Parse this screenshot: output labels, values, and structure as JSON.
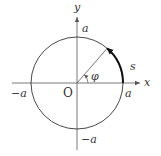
{
  "diagram": {
    "type": "unit-circle-arc-length",
    "colors": {
      "background": "#ffffff",
      "axis": "#555555",
      "circle": "#333333",
      "arc": "#111111",
      "radius": "#555555",
      "text": "#333333"
    },
    "axes": {
      "x_label": "x",
      "y_label": "y"
    },
    "origin_label": "O",
    "tick_labels": {
      "x_positive": "a",
      "x_negative": "−a",
      "y_positive": "a",
      "y_negative": "−a"
    },
    "angle_label": "φ",
    "arc_label": "s",
    "angle_degrees": 49
  }
}
